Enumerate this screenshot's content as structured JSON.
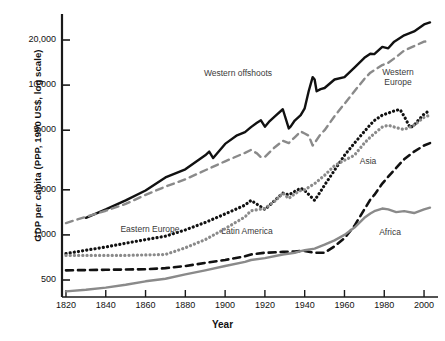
{
  "chart_data": {
    "type": "line",
    "title": "",
    "xlabel": "Year",
    "ylabel": "GDP per capita (PPP, 1990 US$, log scale)",
    "yscale": "log",
    "ylim": [
      380,
      28000
    ],
    "xlim": [
      1818,
      2004
    ],
    "grid": false,
    "legend_position": "inline-annotations",
    "ytick_labels": [
      "20,000",
      "10,000",
      "5,000",
      "2,000",
      "1,000",
      "500"
    ],
    "ytick_values": [
      20000,
      10000,
      5000,
      2000,
      1000,
      500
    ],
    "xtick_labels": [
      "1820",
      "1840",
      "1860",
      "1880",
      "1900",
      "1920",
      "1940",
      "1960",
      "1980",
      "2000"
    ],
    "xtick_values": [
      1820,
      1840,
      1860,
      1880,
      1900,
      1920,
      1940,
      1960,
      1980,
      2000
    ],
    "series": [
      {
        "name": "Western offshoots",
        "label": "Western offshoots",
        "color": "#111111",
        "style": "solid",
        "width": 2.4,
        "label_x": 238,
        "label_y": 73,
        "x": [
          1830,
          1840,
          1850,
          1860,
          1870,
          1880,
          1890,
          1892,
          1894,
          1900,
          1906,
          1910,
          1913,
          1916,
          1918,
          1920,
          1922,
          1925,
          1929,
          1932,
          1933,
          1935,
          1938,
          1940,
          1942,
          1944,
          1945,
          1946,
          1948,
          1950,
          1955,
          1960,
          1965,
          1970,
          1973,
          1975,
          1979,
          1982,
          1985,
          1990,
          1995,
          2000,
          2003
        ],
        "y": [
          1300,
          1480,
          1700,
          1980,
          2420,
          2740,
          3400,
          3600,
          3260,
          4050,
          4620,
          4850,
          5240,
          5600,
          5820,
          5280,
          5680,
          6180,
          6900,
          5140,
          5300,
          5800,
          6300,
          7000,
          9100,
          11300,
          10900,
          9100,
          9400,
          9560,
          10900,
          11300,
          13100,
          15200,
          16200,
          16100,
          18000,
          17600,
          19500,
          21500,
          22800,
          25400,
          26200
        ]
      },
      {
        "name": "Western Europe",
        "label": "Western\nEurope",
        "color": "#8a8a8a",
        "style": "dashed",
        "width": 2.4,
        "label_x": 398,
        "label_y": 72,
        "x": [
          1820,
          1830,
          1840,
          1850,
          1860,
          1870,
          1880,
          1890,
          1900,
          1910,
          1913,
          1916,
          1918,
          1920,
          1925,
          1929,
          1932,
          1935,
          1938,
          1940,
          1942,
          1944,
          1946,
          1948,
          1950,
          1955,
          1960,
          1965,
          1970,
          1973,
          1979,
          1982,
          1986,
          1990,
          1995,
          2000,
          2003
        ],
        "y": [
          1200,
          1320,
          1450,
          1610,
          1850,
          2100,
          2350,
          2700,
          3100,
          3530,
          3690,
          3500,
          3300,
          3320,
          3850,
          4250,
          4100,
          4480,
          4900,
          4750,
          4600,
          3950,
          4300,
          4700,
          5000,
          6200,
          7500,
          9100,
          11000,
          12100,
          13600,
          14100,
          15400,
          17000,
          18200,
          19500,
          19700
        ]
      },
      {
        "name": "Eastern Europe",
        "label": "Eastern Europe",
        "color": "#111111",
        "style": "dotted",
        "width": 3.2,
        "label_x": 150,
        "label_y": 229,
        "x": [
          1820,
          1830,
          1840,
          1850,
          1860,
          1870,
          1880,
          1890,
          1900,
          1910,
          1913,
          1920,
          1925,
          1929,
          1932,
          1935,
          1938,
          1940,
          1945,
          1948,
          1950,
          1955,
          1960,
          1965,
          1970,
          1973,
          1975,
          1979,
          1982,
          1986,
          1988,
          1990,
          1993,
          1995,
          1998,
          2000,
          2003
        ],
        "y": [
          750,
          790,
          830,
          880,
          930,
          980,
          1080,
          1210,
          1380,
          1580,
          1700,
          1480,
          1700,
          1900,
          1850,
          1950,
          2050,
          1980,
          1700,
          1950,
          2150,
          2700,
          3400,
          4100,
          4900,
          5450,
          5800,
          6300,
          6500,
          6800,
          6850,
          6200,
          5200,
          5400,
          6000,
          6400,
          6800
        ]
      },
      {
        "name": "Latin America",
        "label": "Latin America",
        "color": "#8a8a8a",
        "style": "dotted",
        "width": 3.2,
        "label_x": 247,
        "label_y": 231,
        "x": [
          1820,
          1830,
          1840,
          1850,
          1860,
          1870,
          1880,
          1890,
          1900,
          1910,
          1913,
          1920,
          1925,
          1929,
          1932,
          1935,
          1938,
          1940,
          1945,
          1950,
          1955,
          1960,
          1965,
          1970,
          1973,
          1975,
          1979,
          1982,
          1986,
          1990,
          1995,
          2000,
          2003
        ],
        "y": [
          730,
          730,
          730,
          730,
          735,
          740,
          820,
          930,
          1100,
          1320,
          1450,
          1500,
          1680,
          1900,
          1750,
          1880,
          1980,
          2000,
          2200,
          2500,
          2900,
          3150,
          3400,
          4100,
          4500,
          4750,
          5250,
          5400,
          5200,
          5050,
          5400,
          6100,
          6300
        ]
      },
      {
        "name": "Asia",
        "label": "Asia",
        "color": "#111111",
        "style": "dashed",
        "width": 2.6,
        "label_x": 368,
        "label_y": 161,
        "x": [
          1820,
          1840,
          1860,
          1870,
          1880,
          1890,
          1900,
          1910,
          1913,
          1920,
          1929,
          1935,
          1938,
          1940,
          1945,
          1950,
          1955,
          1960,
          1965,
          1970,
          1973,
          1975,
          1979,
          1982,
          1986,
          1990,
          1995,
          2000,
          2003
        ],
        "y": [
          580,
          585,
          590,
          600,
          620,
          650,
          680,
          720,
          740,
          760,
          770,
          775,
          780,
          780,
          760,
          760,
          840,
          950,
          1150,
          1480,
          1720,
          1850,
          2200,
          2450,
          2800,
          3200,
          3600,
          3950,
          4100
        ]
      },
      {
        "name": "Africa",
        "label": "Africa",
        "color": "#8a8a8a",
        "style": "solid",
        "width": 2.4,
        "label_x": 390,
        "label_y": 232,
        "x": [
          1820,
          1830,
          1840,
          1850,
          1860,
          1870,
          1880,
          1890,
          1900,
          1910,
          1913,
          1920,
          1929,
          1935,
          1938,
          1940,
          1945,
          1950,
          1955,
          1960,
          1965,
          1970,
          1973,
          1975,
          1979,
          1982,
          1986,
          1990,
          1995,
          2000,
          2003
        ],
        "y": [
          420,
          430,
          445,
          465,
          490,
          510,
          545,
          580,
          620,
          660,
          680,
          700,
          740,
          760,
          780,
          790,
          810,
          860,
          920,
          1000,
          1120,
          1300,
          1390,
          1440,
          1500,
          1480,
          1420,
          1440,
          1400,
          1480,
          1520
        ]
      }
    ]
  },
  "axes": {
    "y_axis_label": "GDP per capita (PPP, 1990 US$, log scale)",
    "x_axis_label": "Year"
  }
}
